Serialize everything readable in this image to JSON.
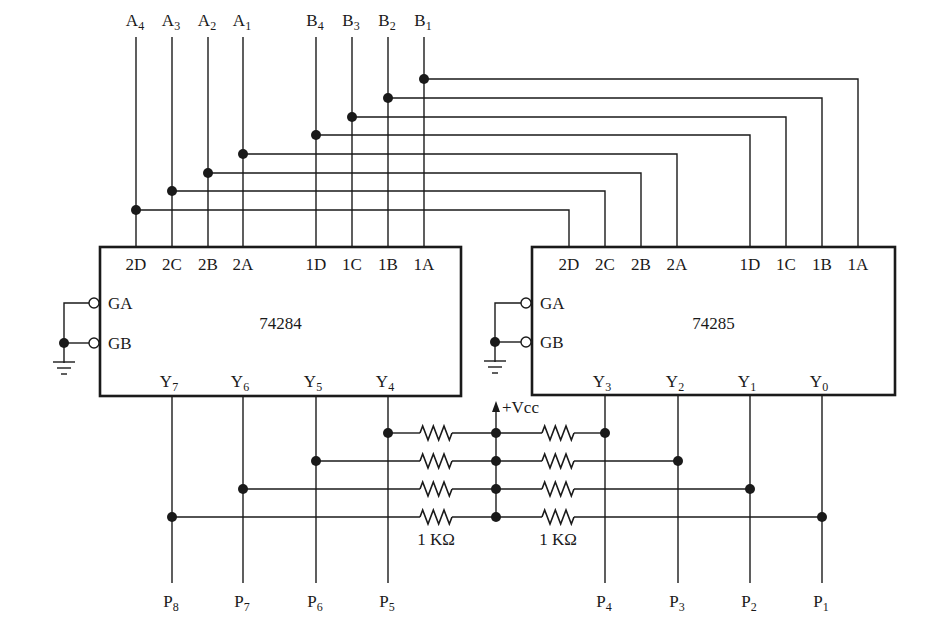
{
  "inputs": {
    "a": [
      {
        "name": "A",
        "sub": "4",
        "x": 136,
        "tap_y": 210
      },
      {
        "name": "A",
        "sub": "3",
        "x": 172,
        "tap_y": 191
      },
      {
        "name": "A",
        "sub": "2",
        "x": 208,
        "tap_y": 173
      },
      {
        "name": "A",
        "sub": "1",
        "x": 243,
        "tap_y": 154
      }
    ],
    "b": [
      {
        "name": "B",
        "sub": "4",
        "x": 316,
        "tap_y": 135
      },
      {
        "name": "B",
        "sub": "3",
        "x": 352,
        "tap_y": 117
      },
      {
        "name": "B",
        "sub": "2",
        "x": 388,
        "tap_y": 98
      },
      {
        "name": "B",
        "sub": "1",
        "x": 424,
        "tap_y": 79
      }
    ]
  },
  "chips": [
    {
      "id": "left",
      "part_number": "74284",
      "box": {
        "x": 100,
        "y": 247,
        "w": 361,
        "h": 149
      },
      "input_pins": [
        {
          "label": "2D",
          "x": 136
        },
        {
          "label": "2C",
          "x": 172
        },
        {
          "label": "2B",
          "x": 208
        },
        {
          "label": "2A",
          "x": 243
        },
        {
          "label": "1D",
          "x": 316
        },
        {
          "label": "1C",
          "x": 352
        },
        {
          "label": "1B",
          "x": 388
        },
        {
          "label": "1A",
          "x": 424
        }
      ],
      "enable_pins": [
        {
          "label": "GA",
          "y": 303
        },
        {
          "label": "GB",
          "y": 343
        }
      ],
      "ground_x": 64,
      "outputs": [
        {
          "name": "Y",
          "sub": "7",
          "x": 172
        },
        {
          "name": "Y",
          "sub": "6",
          "x": 243
        },
        {
          "name": "Y",
          "sub": "5",
          "x": 316
        },
        {
          "name": "Y",
          "sub": "4",
          "x": 388
        }
      ]
    },
    {
      "id": "right",
      "part_number": "74285",
      "box": {
        "x": 532,
        "y": 247,
        "w": 363,
        "h": 148
      },
      "input_pins": [
        {
          "label": "2D",
          "x": 569
        },
        {
          "label": "2C",
          "x": 605
        },
        {
          "label": "2B",
          "x": 641
        },
        {
          "label": "2A",
          "x": 677
        },
        {
          "label": "1D",
          "x": 750
        },
        {
          "label": "1C",
          "x": 786
        },
        {
          "label": "1B",
          "x": 822
        },
        {
          "label": "1A",
          "x": 858
        }
      ],
      "enable_pins": [
        {
          "label": "GA",
          "y": 303
        },
        {
          "label": "GB",
          "y": 342
        }
      ],
      "ground_x": 495,
      "outputs": [
        {
          "name": "Y",
          "sub": "3",
          "x": 605
        },
        {
          "name": "Y",
          "sub": "2",
          "x": 678
        },
        {
          "name": "Y",
          "sub": "1",
          "x": 750
        },
        {
          "name": "Y",
          "sub": "0",
          "x": 822
        }
      ]
    }
  ],
  "pullups": {
    "supply_label": "+Vcc",
    "bus_x": 496,
    "rows_y": [
      433,
      461,
      489,
      517
    ],
    "resistor_label": "1 KΩ",
    "left_resistor_x": [
      420,
      452
    ],
    "right_resistor_x": [
      542,
      574
    ]
  },
  "products": [
    {
      "name": "P",
      "sub": "8",
      "x": 172
    },
    {
      "name": "P",
      "sub": "7",
      "x": 243
    },
    {
      "name": "P",
      "sub": "6",
      "x": 316
    },
    {
      "name": "P",
      "sub": "5",
      "x": 388
    },
    {
      "name": "P",
      "sub": "4",
      "x": 605
    },
    {
      "name": "P",
      "sub": "3",
      "x": 678
    },
    {
      "name": "P",
      "sub": "2",
      "x": 750
    },
    {
      "name": "P",
      "sub": "1",
      "x": 822
    }
  ]
}
